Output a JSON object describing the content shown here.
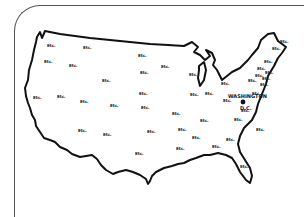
{
  "map": {
    "title": "",
    "outline_color": "#111111",
    "frame_color": "#555555",
    "capital": {
      "name_line1": "WASHINGTON",
      "name_line2": "D.C.",
      "x": 243,
      "y": 99
    },
    "labels": [
      {
        "text": "Etc.",
        "x": 47,
        "y": 47
      },
      {
        "text": "Etc.",
        "x": 83,
        "y": 49
      },
      {
        "text": "Etc.",
        "x": 44,
        "y": 63
      },
      {
        "text": "Etc.",
        "x": 69,
        "y": 67
      },
      {
        "text": "Etc.",
        "x": 138,
        "y": 57
      },
      {
        "text": "Etc.",
        "x": 161,
        "y": 68
      },
      {
        "text": "Etc.",
        "x": 189,
        "y": 76
      },
      {
        "text": "Etc.",
        "x": 140,
        "y": 74
      },
      {
        "text": "Etc.",
        "x": 102,
        "y": 82
      },
      {
        "text": "Etc.",
        "x": 139,
        "y": 95
      },
      {
        "text": "Etc.",
        "x": 33,
        "y": 99
      },
      {
        "text": "Etc.",
        "x": 57,
        "y": 98
      },
      {
        "text": "Etc.",
        "x": 80,
        "y": 103
      },
      {
        "text": "Etc.",
        "x": 110,
        "y": 107
      },
      {
        "text": "Etc.",
        "x": 141,
        "y": 109
      },
      {
        "text": "Etc.",
        "x": 78,
        "y": 132
      },
      {
        "text": "Etc.",
        "x": 103,
        "y": 136
      },
      {
        "text": "Etc.",
        "x": 147,
        "y": 133
      },
      {
        "text": "Etc.",
        "x": 135,
        "y": 155
      },
      {
        "text": "Etc.",
        "x": 172,
        "y": 115
      },
      {
        "text": "Etc.",
        "x": 200,
        "y": 122
      },
      {
        "text": "Etc.",
        "x": 178,
        "y": 131
      },
      {
        "text": "Etc.",
        "x": 192,
        "y": 139
      },
      {
        "text": "Etc.",
        "x": 176,
        "y": 150
      },
      {
        "text": "Etc.",
        "x": 212,
        "y": 148
      },
      {
        "text": "Etc.",
        "x": 226,
        "y": 141
      },
      {
        "text": "Etc.",
        "x": 234,
        "y": 121
      },
      {
        "text": "Etc.",
        "x": 241,
        "y": 112
      },
      {
        "text": "Etc.",
        "x": 256,
        "y": 131
      },
      {
        "text": "Etc.",
        "x": 240,
        "y": 168
      },
      {
        "text": "Etc.",
        "x": 190,
        "y": 96
      },
      {
        "text": "Etc.",
        "x": 205,
        "y": 95
      },
      {
        "text": "Etc.",
        "x": 223,
        "y": 102
      },
      {
        "text": "Etc.",
        "x": 221,
        "y": 85
      },
      {
        "text": "Etc.",
        "x": 252,
        "y": 95
      },
      {
        "text": "Etc.",
        "x": 248,
        "y": 82
      },
      {
        "text": "Etc.",
        "x": 255,
        "y": 77
      },
      {
        "text": "Etc.",
        "x": 260,
        "y": 86
      },
      {
        "text": "Etc.",
        "x": 257,
        "y": 70
      },
      {
        "text": "Etc.",
        "x": 264,
        "y": 63
      },
      {
        "text": "Etc.",
        "x": 265,
        "y": 74
      },
      {
        "text": "Etc.",
        "x": 262,
        "y": 80
      },
      {
        "text": "Etc.",
        "x": 272,
        "y": 50
      },
      {
        "text": "Etc.",
        "x": 280,
        "y": 43
      }
    ]
  }
}
